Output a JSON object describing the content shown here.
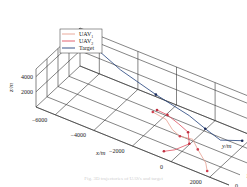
{
  "chart_data": {
    "type": "line",
    "subtype": "3d-trajectory",
    "title": "",
    "xlabel": "x/m",
    "ylabel": "y/m",
    "zlabel": "z/m",
    "xlim": [
      -7000,
      3000
    ],
    "ylim": [
      0,
      4000
    ],
    "zlim": [
      0,
      5000
    ],
    "xticks": [
      -6000,
      -4000,
      -2000,
      0,
      2000
    ],
    "yticks": [
      0,
      1000,
      2000,
      3000,
      4000
    ],
    "zticks": [
      2000,
      4000
    ],
    "grid": true,
    "legend_position": "top-left",
    "legend": [
      {
        "name": "UAV1",
        "label_main": "UAV",
        "label_sub": "1",
        "color": "#e8a090"
      },
      {
        "name": "UAV2",
        "label_main": "UAV",
        "label_sub": "2",
        "color": "#e05060"
      },
      {
        "name": "Target",
        "label_main": "Target",
        "label_sub": "",
        "color": "#1f3f7a"
      }
    ],
    "series": [
      {
        "name": "Target",
        "color": "#1f3f7a",
        "marker_color": "#1a2a5a",
        "points": [
          {
            "x": -6200,
            "y": 3700,
            "z": 4000
          },
          {
            "x": -4500,
            "y": 3300,
            "z": 3000
          },
          {
            "x": -2500,
            "y": 3000,
            "z": 2200
          },
          {
            "x": -600,
            "y": 2700,
            "z": 1800
          },
          {
            "x": 400,
            "y": 2400,
            "z": 1500
          },
          {
            "x": 1300,
            "y": 2200,
            "z": 1200
          },
          {
            "x": 2200,
            "y": 2600,
            "z": 1500
          }
        ],
        "markers": [
          0,
          2,
          4,
          6
        ]
      },
      {
        "name": "UAV1",
        "color": "#e8a090",
        "marker_color": "#d04050",
        "points": [
          {
            "x": -2200,
            "y": 2200,
            "z": 1300
          },
          {
            "x": -1400,
            "y": 2000,
            "z": 1400
          },
          {
            "x": -900,
            "y": 1700,
            "z": 1000
          },
          {
            "x": -400,
            "y": 1500,
            "z": 900
          },
          {
            "x": 200,
            "y": 1600,
            "z": 1000
          },
          {
            "x": 700,
            "y": 1200,
            "z": 700
          },
          {
            "x": 1400,
            "y": 700,
            "z": 300
          },
          {
            "x": 1700,
            "y": 300,
            "z": 100
          }
        ],
        "markers": [
          0,
          3,
          5,
          7
        ]
      },
      {
        "name": "UAV2",
        "color": "#e05060",
        "marker_color": "#c03040",
        "points": [
          {
            "x": -2100,
            "y": 2400,
            "z": 1400
          },
          {
            "x": -1500,
            "y": 2300,
            "z": 1500
          },
          {
            "x": -800,
            "y": 2100,
            "z": 1300
          },
          {
            "x": -200,
            "y": 1900,
            "z": 1100
          },
          {
            "x": 200,
            "y": 1300,
            "z": 800
          },
          {
            "x": -200,
            "y": 700,
            "z": 400
          },
          {
            "x": -600,
            "y": 400,
            "z": 200
          }
        ],
        "markers": [
          0,
          1,
          3,
          4,
          6
        ]
      }
    ]
  },
  "caption": "Fig. 3D trajectories of UAVs and target"
}
